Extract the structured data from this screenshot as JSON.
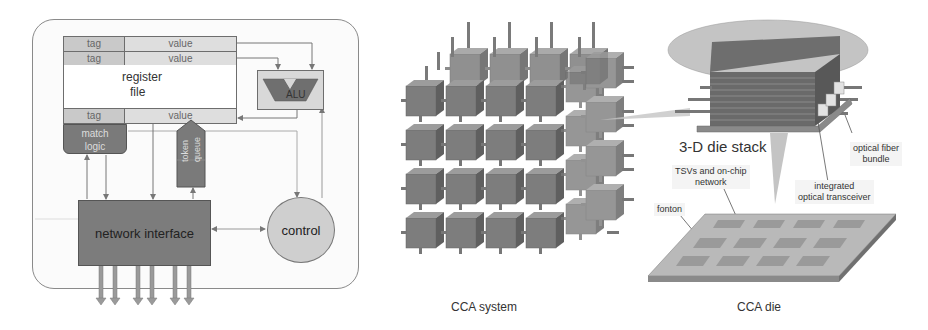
{
  "left_panel": {
    "register_file": {
      "rows_top": [
        {
          "tag": "tag",
          "value": "value"
        },
        {
          "tag": "tag",
          "value": "value"
        }
      ],
      "label_line1": "register",
      "label_line2": "file",
      "row_bottom": {
        "tag": "tag",
        "value": "value"
      }
    },
    "alu_label": "ALU",
    "match_logic_line1": "match",
    "match_logic_line2": "logic",
    "token_queue_line1": "token",
    "token_queue_line2": "queue",
    "network_interface_label": "network interface",
    "control_label": "control",
    "io_arrow_count": 6
  },
  "middle_panel": {
    "caption": "CCA system",
    "grid_size": "4x4x4"
  },
  "right_panel": {
    "stack_label": "3-D die stack",
    "annotations": {
      "optical_fiber": [
        "optical fiber",
        "bundle"
      ],
      "transceiver": [
        "integrated",
        "optical transceiver"
      ],
      "tsv": [
        "TSVs and on-chip",
        "network"
      ],
      "fonton": "fonton"
    },
    "caption": "CCA die"
  },
  "colors": {
    "dark_block": "#7c7c7c",
    "light_block": "#d8d8d8",
    "tag_fill": "#c9c9c9",
    "value_fill": "#dedede",
    "frame": "#8a8a8a",
    "ellipse": "#c4c4c4"
  }
}
